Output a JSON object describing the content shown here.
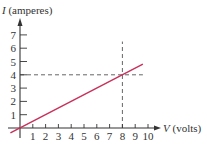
{
  "chart_data": {
    "type": "line",
    "title": "",
    "xlabel": {
      "symbol": "V",
      "unit": " (volts)"
    },
    "ylabel": {
      "symbol": "I",
      "unit": " (amperes)"
    },
    "xlim": [
      0,
      10
    ],
    "ylim": [
      0,
      7
    ],
    "x_ticks": [
      1,
      2,
      3,
      4,
      5,
      6,
      7,
      8,
      9,
      10
    ],
    "y_ticks": [
      1,
      2,
      3,
      4,
      5,
      6,
      7
    ],
    "grid": false,
    "series": [
      {
        "name": "I = 0.5 V",
        "color": "#c8305a",
        "x": [
          -0.75,
          9.6
        ],
        "y": [
          -0.375,
          4.8
        ]
      }
    ],
    "annotations": [
      {
        "type": "vertical-dashed",
        "x": 8,
        "y_range": [
          0,
          6.5
        ]
      },
      {
        "type": "horizontal-dashed",
        "y": 4,
        "x_range": [
          0,
          9.6
        ]
      }
    ],
    "colors": {
      "axis": "#333333",
      "dashed": "#555555"
    }
  }
}
